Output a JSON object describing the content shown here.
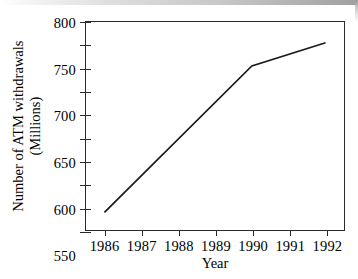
{
  "chart_data": {
    "type": "line",
    "title": "",
    "xlabel": "Year",
    "ylabel": "Number of ATM withdrawals (Millions)",
    "ylabel_line1": "Number of ATM withdrawals",
    "ylabel_line2": "(Millions)",
    "x": [
      1986,
      1987,
      1988,
      1989,
      1990,
      1991,
      1992
    ],
    "categories": [
      "1986",
      "1987",
      "1988",
      "1989",
      "1990",
      "1991",
      "1992"
    ],
    "values": [
      388,
      468,
      547,
      626,
      705,
      730,
      755
    ],
    "series": [
      {
        "name": "Number of ATM withdrawals",
        "values": [
          388,
          468,
          547,
          626,
          705,
          730,
          755
        ]
      }
    ],
    "vertices": [
      {
        "x": 1986,
        "y": 388
      },
      {
        "x": 1990,
        "y": 705
      },
      {
        "x": 1992,
        "y": 755
      }
    ],
    "xlim": [
      1985.5,
      1992.5
    ],
    "ylim": [
      350,
      800
    ],
    "ytick_labels": [
      "800",
      "750",
      "700",
      "650",
      "600",
      "550",
      "500",
      "450",
      "400",
      "350"
    ],
    "ytick_values": [
      800,
      750,
      700,
      650,
      600,
      550,
      500,
      450,
      400,
      350
    ],
    "ytick_step": 50,
    "grid": false,
    "legend": false,
    "legend_position": "none",
    "line_color": "#1a1a1a",
    "frame_color": "#2b2b2b",
    "background_color": "#ffffff"
  }
}
